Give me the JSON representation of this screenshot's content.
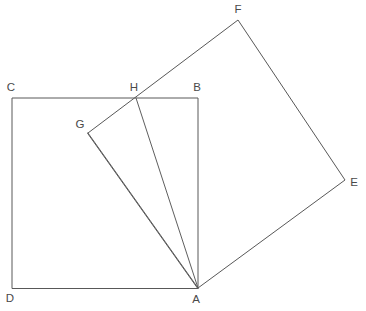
{
  "figure": {
    "background_color": "#ffffff",
    "line_color": "#585858",
    "label_color": "#4a4a4a",
    "width": 366,
    "height": 311
  },
  "points": {
    "A": {
      "label": "A",
      "x": 198,
      "y": 288,
      "label_x": 196,
      "label_y": 300
    },
    "B": {
      "label": "B",
      "x": 198,
      "y": 98,
      "label_x": 197,
      "label_y": 88
    },
    "C": {
      "label": "C",
      "x": 12,
      "y": 98,
      "label_x": 11,
      "label_y": 88
    },
    "D": {
      "label": "D",
      "x": 12,
      "y": 288,
      "label_x": 10,
      "label_y": 299
    },
    "E": {
      "label": "E",
      "x": 345,
      "y": 180,
      "label_x": 354,
      "label_y": 183
    },
    "F": {
      "label": "F",
      "x": 238,
      "y": 20,
      "label_x": 238,
      "label_y": 10
    },
    "G": {
      "label": "G",
      "x": 88,
      "y": 133,
      "label_x": 80,
      "label_y": 125
    },
    "H": {
      "label": "H",
      "x": 136,
      "y": 98,
      "label_x": 134,
      "label_y": 88
    }
  },
  "shapes": {
    "upright_square": {
      "name": "square-ABDC",
      "path": "M 198 288 L 198 98 L 12 98 L 12 288 Z",
      "vertex_order": [
        "A",
        "B",
        "C",
        "D"
      ]
    },
    "rotated_square": {
      "name": "square-AEFG",
      "path": "M 198 288 L 345 180 L 238 20 L 88 133 Z",
      "vertex_order": [
        "A",
        "E",
        "F",
        "G"
      ]
    }
  },
  "segments": [
    {
      "name": "segment-AG",
      "from": "A",
      "to": "G",
      "path": "M 198 288 L 88 133"
    },
    {
      "name": "segment-AH",
      "from": "A",
      "to": "H",
      "path": "M 198 288 L 136 98"
    }
  ]
}
